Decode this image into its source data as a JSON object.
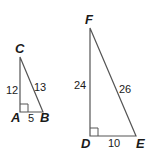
{
  "diagram": {
    "triangles": [
      {
        "name": "ABC",
        "vertices": {
          "top": "C",
          "right_angle": "A",
          "base_end": "B"
        },
        "sides": {
          "vertical": "12",
          "hypotenuse": "13",
          "base": "5"
        }
      },
      {
        "name": "DEF",
        "vertices": {
          "top": "F",
          "right_angle": "D",
          "base_end": "E"
        },
        "sides": {
          "vertical": "24",
          "hypotenuse": "26",
          "base": "10"
        }
      }
    ],
    "colors": {
      "line": "#555555",
      "text": "#1a1a1a"
    }
  }
}
